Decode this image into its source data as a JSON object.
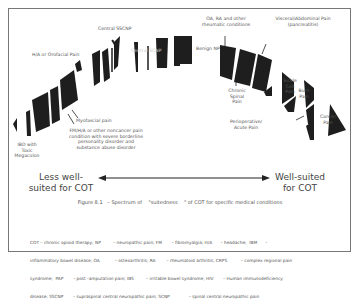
{
  "figure": {
    "caption": "Figure 8.1   – Spectrum of    \"suitedness    \" of COT for specific medical conditions",
    "left_end_label": "Less well-suited for COT",
    "right_end_label": "Well-suited for COT",
    "colors": {
      "segment_fill": "#1e1e1e",
      "frame": "#777777",
      "text": "#555555",
      "arrow": "#222222"
    }
  },
  "labels": {
    "ibd": "IBD with Toxic Megacolon",
    "ha_orofacial": "H/A or Orofacial Pain",
    "myofascial": "Myofascial pain",
    "fm_ha": "FM/H/A or other noncancer pain condition with severe borderline personality disorder and substance abuse disorder",
    "central_sscnp_top": "Central SSCNP",
    "central_scnp": "Central SCNP",
    "benign_np": "Benign NP",
    "oa_ra": "OA, RA and other rheumatic conditions",
    "chronic_spinal": "Chronic Spinal Pain",
    "visceral": "Visceral/Abdominal Pain (pancreatitis)",
    "sickle_cell": "Sickle Cell Pain",
    "burn": "Burn Pain",
    "perioperative": "Perioperative/ Acute Pain",
    "cancer": "Cancer Pain",
    "fibro_inner": "Fibro Pain"
  },
  "legend": {
    "line1": "COT – chronic opioid therapy; NP         – neuropathic pain; FM       – fibromyalgia; H/A      – headache;  IBM      –",
    "line2": "inflammatory bowel disease; OA           – osteoarthritis; RA        – rheumatoid arthritis; CRPS          – complex regional pain",
    "line3": "syndrome;  PAP       – post -amputation pain; IBS         – irritable bowel syndrome; HIV       – Human immunodeficiency",
    "line4": "disease; SSCNP       – supraspinal central neuropathic pain; SCNP              – spinal central neuropathic pain"
  }
}
